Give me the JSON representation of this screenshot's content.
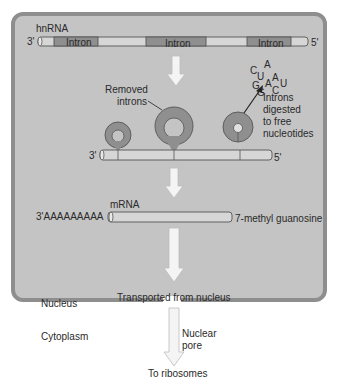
{
  "hnrna": {
    "label": "hnRNA",
    "end_3": "3'",
    "end_5": "5'",
    "introns": [
      "Intron",
      "Intron",
      "Intron"
    ]
  },
  "splicing": {
    "removed_introns_label": "Removed introns",
    "removed_introns_line1": "Removed",
    "removed_introns_line2": "introns",
    "digested_line1": "Introns",
    "digested_line2": "digested",
    "digested_line3": "to free",
    "digested_line4": "nucleotides",
    "nucleotides": [
      "C",
      "U",
      "A",
      "A",
      "G",
      "A",
      "U",
      "G",
      "C"
    ],
    "end_3": "3'",
    "end_5": "5'"
  },
  "mrna": {
    "label": "mRNA",
    "poly_a_tail": "3'AAAAAAAAA",
    "cap": "7-methyl guanosine"
  },
  "transport": {
    "label": "Transported from nucleus",
    "nucleus_label": "Nucleus",
    "cytoplasm_label": "Cytoplasm",
    "pore_line1": "Nuclear",
    "pore_line2": "pore",
    "destination": "To ribosomes"
  },
  "colors": {
    "nucleus_fill": "#c4c4c4",
    "nucleus_border": "#8e8e8e",
    "exon_fill": "#d6d6d6",
    "intron_fill": "#8f8f8f",
    "arrow_fill": "#f4f4f4"
  }
}
